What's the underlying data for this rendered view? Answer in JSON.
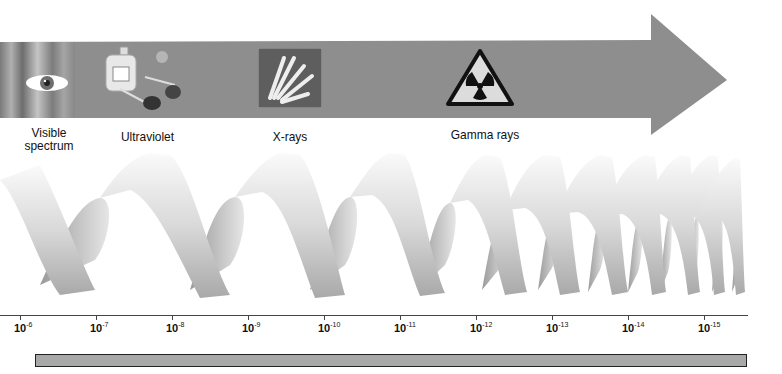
{
  "diagram": {
    "arrow": {
      "direction": "right",
      "color": "#8f8f8f"
    },
    "categories": [
      {
        "id": "visible",
        "label_line1": "Visible",
        "label_line2": "spectrum",
        "icon": "eye-icon"
      },
      {
        "id": "ultraviolet",
        "label": "Ultraviolet",
        "icon": "sunscreen-sunglasses-icon"
      },
      {
        "id": "xrays",
        "label": "X-rays",
        "icon": "xray-hand-icon"
      },
      {
        "id": "gamma",
        "label": "Gamma rays",
        "icon": "radiation-warning-icon"
      }
    ],
    "axis": {
      "ticks": [
        {
          "base": "10",
          "exp": "-6"
        },
        {
          "base": "10",
          "exp": "-7"
        },
        {
          "base": "10",
          "exp": "-8"
        },
        {
          "base": "10",
          "exp": "-9"
        },
        {
          "base": "10",
          "exp": "-10"
        },
        {
          "base": "10",
          "exp": "-11"
        },
        {
          "base": "10",
          "exp": "-12"
        },
        {
          "base": "10",
          "exp": "-13"
        },
        {
          "base": "10",
          "exp": "-14"
        },
        {
          "base": "10",
          "exp": "-15"
        }
      ]
    },
    "wave": {
      "description": "ribbon wave with decreasing wavelength left to right"
    },
    "bar": {
      "color": "#a8a8a8"
    }
  }
}
